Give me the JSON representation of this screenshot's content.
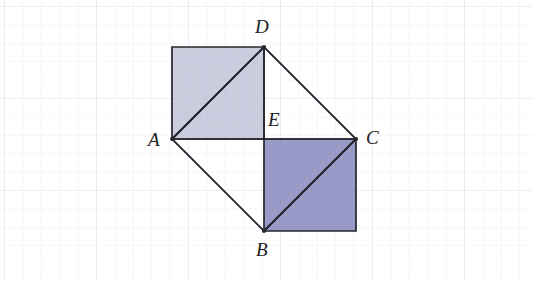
{
  "figure": {
    "background_color": "#ffffff",
    "grid": {
      "visible": true,
      "spacing_px": 18.4,
      "color": "#e9e9ef",
      "minor_color": "#f3f3f7"
    },
    "stroke": {
      "color": "#26262e",
      "width_px": 1.7
    },
    "shading": {
      "upper_square_fill": "#ccccdf",
      "lower_square_fill": "#9a9ac8",
      "unshaded_fill": "#ffffff"
    },
    "points": {
      "A": {
        "label": "A",
        "x": 172,
        "y": 139
      },
      "B": {
        "label": "B",
        "x": 264,
        "y": 231
      },
      "C": {
        "label": "C",
        "x": 356,
        "y": 139
      },
      "D": {
        "label": "D",
        "x": 264,
        "y": 47
      },
      "E": {
        "label": "E",
        "x": 264,
        "y": 139
      },
      "F": {
        "label": "",
        "x": 172,
        "y": 47
      },
      "G": {
        "label": "",
        "x": 356,
        "y": 231
      }
    },
    "shapes": [
      {
        "name": "upper-left-shaded-square",
        "vertices": "A F D E",
        "fill": "#ccccdf"
      },
      {
        "name": "lower-right-shaded-square",
        "vertices": "E C G B",
        "fill": "#9a9ac8"
      }
    ],
    "segments": [
      {
        "name": "segment-AD",
        "from": "A",
        "to": "D"
      },
      {
        "name": "segment-DC",
        "from": "D",
        "to": "C"
      },
      {
        "name": "segment-CB",
        "from": "C",
        "to": "B"
      },
      {
        "name": "segment-BA",
        "from": "B",
        "to": "A"
      },
      {
        "name": "segment-AC",
        "from": "A",
        "to": "C"
      },
      {
        "name": "segment-DE",
        "from": "D",
        "to": "E"
      },
      {
        "name": "segment-AF",
        "from": "A",
        "to": "F"
      },
      {
        "name": "segment-FD",
        "from": "F",
        "to": "D"
      },
      {
        "name": "segment-CG",
        "from": "C",
        "to": "G"
      },
      {
        "name": "segment-GB",
        "from": "G",
        "to": "B"
      }
    ]
  }
}
